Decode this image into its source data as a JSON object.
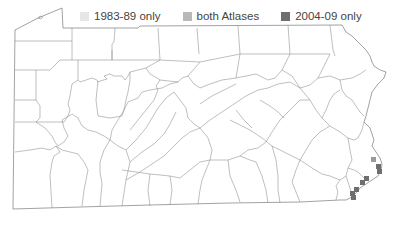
{
  "legend": {
    "items": [
      {
        "label": "1983-89 only",
        "color": "#e6e6e6"
      },
      {
        "label": "both Atlases",
        "color": "#b8b8b8"
      },
      {
        "label": "2004-09 only",
        "color": "#6e6e6e"
      }
    ]
  },
  "map": {
    "region": "Pennsylvania counties",
    "occurrence_blocks": [
      {
        "x": 373,
        "y": 159,
        "category": "both Atlases"
      },
      {
        "x": 378,
        "y": 166,
        "category": "2004-09 only"
      },
      {
        "x": 379,
        "y": 171,
        "category": "2004-09 only"
      },
      {
        "x": 366,
        "y": 178,
        "category": "2004-09 only"
      },
      {
        "x": 362,
        "y": 182,
        "category": "2004-09 only"
      },
      {
        "x": 356,
        "y": 189,
        "category": "2004-09 only"
      },
      {
        "x": 352,
        "y": 193,
        "category": "2004-09 only"
      },
      {
        "x": 353,
        "y": 197,
        "category": "2004-09 only"
      }
    ]
  }
}
